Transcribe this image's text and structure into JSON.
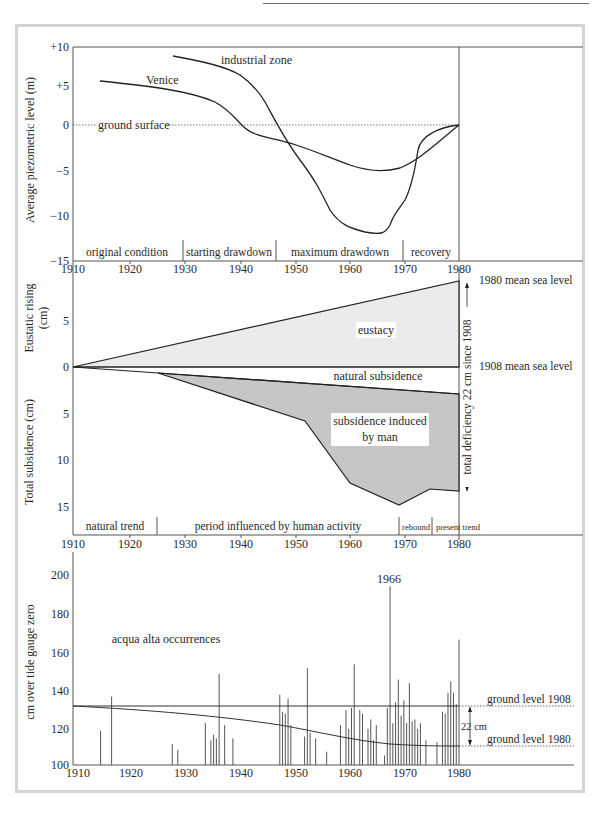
{
  "chart_data": [
    {
      "type": "line",
      "title": "Average piezometric level",
      "ylabel": "Average piezometric level (m)",
      "xlabel": "",
      "ylim": [
        -15,
        10
      ],
      "xlim": [
        1910,
        1980
      ],
      "yticks": [
        "+10",
        "+5",
        "0",
        "−5",
        "−10",
        "−15"
      ],
      "xticks": [
        "1910",
        "1920",
        "1930",
        "1940",
        "1950",
        "1960",
        "1970",
        "1980"
      ],
      "reference_line": {
        "label": "ground surface",
        "y": 0,
        "style": "dotted"
      },
      "series": [
        {
          "name": "Venice",
          "x": [
            1915,
            1925,
            1935,
            1940,
            1945,
            1950,
            1955,
            1960,
            1965,
            1970,
            1975,
            1980
          ],
          "y": [
            5.8,
            5.0,
            3.7,
            2.2,
            -0.8,
            -1.6,
            -2.6,
            -3.8,
            -4.5,
            -4.6,
            -2.5,
            0.3
          ]
        },
        {
          "name": "industrial zone",
          "x": [
            1928,
            1935,
            1940,
            1945,
            1950,
            1955,
            1960,
            1965,
            1970,
            1972,
            1975,
            1977,
            1980
          ],
          "y": [
            8.8,
            8.0,
            6.8,
            4.2,
            -1.0,
            -5.5,
            -9.0,
            -11.2,
            -11.8,
            -9.0,
            -7.0,
            -3.0,
            0.3
          ]
        }
      ],
      "phases": [
        {
          "label": "original condition",
          "from": 1910,
          "to": 1930
        },
        {
          "label": "starting drawdown",
          "from": 1930,
          "to": 1947
        },
        {
          "label": "maximum drawdown",
          "from": 1947,
          "to": 1970
        },
        {
          "label": "recovery",
          "from": 1970,
          "to": 1980
        }
      ]
    },
    {
      "type": "area",
      "title": "Eustatic rising and total subsidence",
      "ylabel_top": "Eustatic rising (cm)",
      "ylabel_bottom": "Total subsidence (cm)",
      "xlim": [
        1910,
        1980
      ],
      "yticks_top": [
        "5",
        "0"
      ],
      "yticks_bottom": [
        "5",
        "10",
        "15"
      ],
      "xticks": [
        "1910",
        "1920",
        "1930",
        "1940",
        "1950",
        "1960",
        "1970",
        "1980"
      ],
      "series": [
        {
          "name": "eustacy",
          "x": [
            1910,
            1980
          ],
          "y": [
            0,
            9
          ]
        },
        {
          "name": "natural subsidence",
          "x": [
            1910,
            1925,
            1980
          ],
          "y": [
            0,
            -0.6,
            -3.0
          ]
        },
        {
          "name": "subsidence induced by man",
          "x": [
            1910,
            1925,
            1952,
            1961,
            1969,
            1975,
            1980
          ],
          "y": [
            0,
            -0.6,
            -6.0,
            -12.3,
            -14.8,
            -13.0,
            -13.3
          ]
        }
      ],
      "annotations": [
        "1980 mean sea level",
        "1908 mean sea level",
        "total deficiency 22 cm since 1908"
      ],
      "phases": [
        {
          "label": "natural trend",
          "from": 1910,
          "to": 1925
        },
        {
          "label": "period influenced by human activity",
          "from": 1925,
          "to": 1969
        },
        {
          "label": "rebound",
          "from": 1969,
          "to": 1975
        },
        {
          "label": "present trend",
          "from": 1975,
          "to": 1980
        }
      ]
    },
    {
      "type": "bar",
      "title": "acqua alta occurrences",
      "ylabel": "cm over tide gauge zero",
      "ylim": [
        100,
        210
      ],
      "xlim": [
        1910,
        1980
      ],
      "yticks": [
        "200",
        "180",
        "160",
        "140",
        "120",
        "100"
      ],
      "xticks": [
        "1910",
        "1920",
        "1930",
        "1940",
        "1950",
        "1960",
        "1970",
        "1980"
      ],
      "annotations": [
        "1966",
        "22 cm",
        "ground level 1908",
        "ground level 1980"
      ],
      "reference_lines": [
        {
          "label": "ground level 1908",
          "y": 131
        },
        {
          "label": "ground level 1980",
          "y": 110
        }
      ],
      "x": [
        1915,
        1917,
        1928,
        1929,
        1934,
        1935,
        1935.5,
        1936,
        1936.5,
        1937.5,
        1939,
        1947.5,
        1948,
        1948.5,
        1949,
        1949.5,
        1952,
        1952.5,
        1953,
        1954,
        1956,
        1958.5,
        1959.5,
        1960,
        1960.5,
        1961,
        1962,
        1962.5,
        1963.5,
        1964,
        1964.5,
        1965,
        1966.5,
        1967,
        1967.5,
        1968,
        1968.5,
        1969,
        1969.5,
        1970,
        1970.5,
        1971,
        1971.5,
        1972,
        1972.5,
        1973,
        1974,
        1976,
        1977,
        1977.5,
        1978,
        1978.5,
        1979,
        1979.5,
        1980
      ],
      "values": [
        118,
        136,
        111,
        108,
        122,
        113,
        116,
        114,
        148,
        121,
        114,
        137,
        128,
        127,
        135,
        121,
        115,
        151,
        117,
        114,
        107,
        121,
        129,
        119,
        130,
        153,
        129,
        127,
        119,
        124,
        113,
        121,
        105,
        130,
        194,
        122,
        133,
        145,
        126,
        134,
        122,
        143,
        123,
        124,
        119,
        122,
        113,
        112,
        128,
        127,
        138,
        144,
        138,
        132,
        166
      ]
    }
  ],
  "panel1": {
    "ylabel": "Average piezometric level (m)",
    "yticks": [
      "+10",
      "+5",
      "0",
      "−5",
      "−10",
      "−15"
    ],
    "xticks": [
      "1910",
      "1920",
      "1930",
      "1940",
      "1950",
      "1960",
      "1970",
      "1980"
    ],
    "labels": {
      "industrial": "industrial zone",
      "venice": "Venice",
      "ground": "ground surface"
    },
    "phases": [
      "original condition",
      "starting drawdown",
      "maximum drawdown",
      "recovery"
    ]
  },
  "panel2": {
    "ylabel_top": "Eustatic rising",
    "ylabel_top2": "(cm)",
    "ylabel_bottom": "Total subsidence (cm)",
    "yticks": [
      "5",
      "0",
      "5",
      "10",
      "15"
    ],
    "xticks": [
      "1910",
      "1920",
      "1930",
      "1940",
      "1950",
      "1960",
      "1970",
      "1980"
    ],
    "labels": {
      "eustacy": "eustacy",
      "natural": "natural subsidence",
      "man1": "subsidence induced",
      "man2": "by man",
      "msl1980": "1980 mean sea level",
      "msl1908": "1908 mean sea level",
      "deficiency": "total deficiency 22 cm since 1908"
    },
    "phases": [
      "natural trend",
      "period influenced by human activity",
      "rebound",
      "present trend"
    ]
  },
  "panel3": {
    "ylabel": "cm over tide gauge zero",
    "yticks": [
      "200",
      "180",
      "160",
      "140",
      "120",
      "100"
    ],
    "xticks": [
      "1910",
      "1920",
      "1930",
      "1940",
      "1950",
      "1960",
      "1970",
      "1980"
    ],
    "labels": {
      "title": "acqua alta occurrences",
      "y1966": "1966",
      "gl1908": "ground level 1908",
      "gl1980": "ground level 1980",
      "diff": "22 cm"
    }
  },
  "colors": {
    "eustacy_fill": "#ebebeb",
    "man_fill": "#c6c6c6",
    "frame": "#d4d4d4",
    "ink": "#2a2a2a"
  }
}
